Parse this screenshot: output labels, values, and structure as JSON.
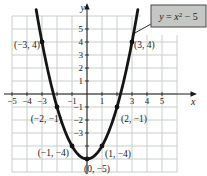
{
  "figure": {
    "bg": "#ffffff",
    "grid_color": "#c8cfc8",
    "axis_color": "#1a1a1a",
    "curve_color": "#151515",
    "point_color": "#111111",
    "callout": {
      "fill": "#c5c7c4",
      "border": "#4a4a4a",
      "eq_y": "y",
      "eq_equals": " = ",
      "eq_x": "x",
      "eq_power": "2",
      "eq_rest": " − 5"
    }
  },
  "chart_data": {
    "type": "line",
    "equation": "y = x² − 5",
    "xlabel": "x",
    "ylabel": "y",
    "xlim": [
      -5,
      6
    ],
    "ylim": [
      -6,
      6
    ],
    "grid": true,
    "x": [
      -3,
      -2,
      -1,
      0,
      1,
      2,
      3
    ],
    "y": [
      4,
      -1,
      -4,
      -5,
      -4,
      -1,
      4
    ],
    "x_ticks": [
      {
        "v": -5,
        "label": "−5"
      },
      {
        "v": -4,
        "label": "−4"
      },
      {
        "v": -3,
        "label": "−3"
      },
      {
        "v": -1,
        "label": "−1"
      },
      {
        "v": 1,
        "label": "1"
      },
      {
        "v": 3,
        "label": "3"
      },
      {
        "v": 4,
        "label": "4"
      },
      {
        "v": 5,
        "label": "5"
      }
    ],
    "y_ticks": [
      {
        "v": 5,
        "label": "5"
      },
      {
        "v": 4,
        "label": "4"
      },
      {
        "v": 3,
        "label": "3"
      },
      {
        "v": 2,
        "label": "2"
      },
      {
        "v": 1,
        "label": "1"
      },
      {
        "v": -1,
        "label": "−1"
      },
      {
        "v": -2,
        "label": "−2"
      },
      {
        "v": -3,
        "label": "−3"
      }
    ],
    "points": [
      {
        "x": -3,
        "y": 4,
        "label": "(−3, 4)",
        "anchor": "end",
        "dx": -2,
        "dy": 6
      },
      {
        "x": 3,
        "y": 4,
        "label": "(3, 4)",
        "anchor": "start",
        "dx": 2,
        "dy": 6
      },
      {
        "x": -2,
        "y": -1,
        "label": "(−2, −1)",
        "anchor": "end",
        "dx": 5,
        "dy": 15
      },
      {
        "x": 2,
        "y": -1,
        "label": "(2, −1)",
        "anchor": "start",
        "dx": 4,
        "dy": 15
      },
      {
        "x": -1,
        "y": -4,
        "label": "(−1, −4)",
        "anchor": "end",
        "dx": -3,
        "dy": 10
      },
      {
        "x": 1,
        "y": -4,
        "label": "(1, −4)",
        "anchor": "start",
        "dx": 3,
        "dy": 11
      },
      {
        "x": 0,
        "y": -5,
        "label": "(0, −5)",
        "anchor": "start",
        "dx": -3,
        "dy": 13
      }
    ],
    "curve": {
      "fn": "x*x - 5",
      "x_min": -3.39,
      "x_max": 3.39
    }
  }
}
